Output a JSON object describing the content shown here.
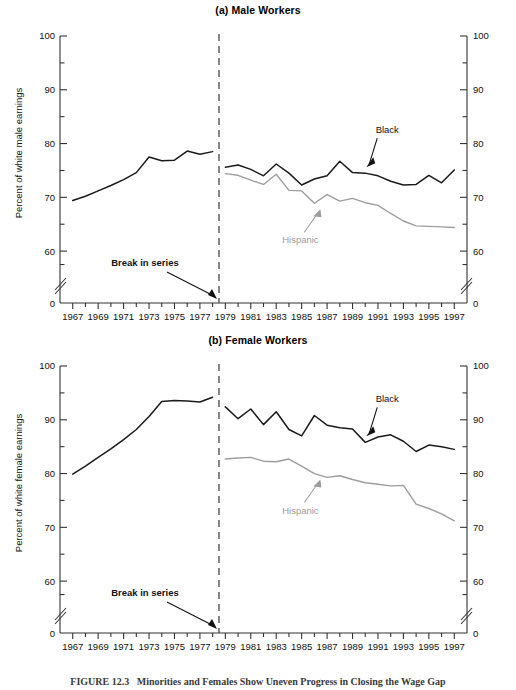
{
  "figure": {
    "caption_label": "FIGURE 12.3",
    "caption_text": "Minorities and Females Show Uneven Progress in Closing the Wage Gap"
  },
  "panels": {
    "male": {
      "title": "(a) Male Workers",
      "ylabel": "Percent of white male earnings",
      "xlabel": "Year",
      "break_label": "Break in series",
      "black_label": "Black",
      "hispanic_label": "Hispanic"
    },
    "female": {
      "title": "(b) Female Workers",
      "ylabel": "Percent of white female earnings",
      "xlabel": "Year",
      "break_label": "Break in series",
      "black_label": "Black",
      "hispanic_label": "Hispanic"
    }
  },
  "colors": {
    "black_series": "#1a1a1a",
    "hispanic_series": "#9d9d9d",
    "axis": "#333333",
    "break_line": "#555555"
  },
  "chart_data": [
    {
      "type": "line",
      "title": "(a) Male Workers",
      "xlabel": "Year",
      "ylabel": "Percent of white male earnings",
      "xlim": [
        1966,
        1998
      ],
      "ylim": [
        55,
        100
      ],
      "yticks": [
        60,
        70,
        80,
        90,
        100
      ],
      "yticks_minor": [
        65,
        75,
        85,
        95
      ],
      "ytick_zero_label": "0",
      "axis_break": true,
      "xticks": [
        1967,
        1969,
        1971,
        1973,
        1975,
        1977,
        1979,
        1981,
        1983,
        1985,
        1987,
        1989,
        1991,
        1993,
        1995,
        1997
      ],
      "grid": false,
      "legend": "inline-annotations",
      "annotations": [
        {
          "text": "Break in series",
          "year": 1978.5,
          "note": "vertical dashed line marking methodology break"
        },
        {
          "text": "Black",
          "points_to_series": "Black"
        },
        {
          "text": "Hispanic",
          "points_to_series": "Hispanic"
        }
      ],
      "series": [
        {
          "name": "Black (pre-break)",
          "color": "#1a1a1a",
          "x": [
            1967,
            1968,
            1969,
            1970,
            1971,
            1972,
            1973,
            1974,
            1975,
            1976,
            1977,
            1978
          ],
          "values": [
            69.4,
            70.2,
            71.2,
            72.2,
            73.3,
            74.6,
            77.5,
            76.8,
            76.9,
            78.6,
            78.0,
            78.5
          ]
        },
        {
          "name": "Black",
          "color": "#1a1a1a",
          "x": [
            1979,
            1980,
            1981,
            1982,
            1983,
            1984,
            1985,
            1986,
            1987,
            1988,
            1989,
            1990,
            1991,
            1992,
            1993,
            1994,
            1995,
            1996,
            1997
          ],
          "values": [
            75.6,
            76.0,
            75.2,
            74.0,
            76.2,
            74.5,
            72.3,
            73.4,
            74.0,
            76.7,
            74.6,
            74.5,
            74.0,
            73.0,
            72.3,
            72.4,
            74.1,
            72.7,
            75.1
          ]
        },
        {
          "name": "Hispanic",
          "color": "#9d9d9d",
          "x": [
            1979,
            1980,
            1981,
            1982,
            1983,
            1984,
            1985,
            1986,
            1987,
            1988,
            1989,
            1990,
            1991,
            1992,
            1993,
            1994,
            1995,
            1996,
            1997
          ],
          "values": [
            74.4,
            74.1,
            73.2,
            72.4,
            74.3,
            71.3,
            71.2,
            68.9,
            70.5,
            69.3,
            69.8,
            69.0,
            68.5,
            67.0,
            65.6,
            64.7,
            64.6,
            64.5,
            64.4
          ]
        }
      ]
    },
    {
      "type": "line",
      "title": "(b) Female Workers",
      "xlabel": "Year",
      "ylabel": "Percent of white female earnings",
      "xlim": [
        1966,
        1998
      ],
      "ylim": [
        55,
        100
      ],
      "yticks": [
        60,
        70,
        80,
        90,
        100
      ],
      "yticks_minor": [
        65,
        75,
        85,
        95
      ],
      "ytick_zero_label": "0",
      "axis_break": true,
      "xticks": [
        1967,
        1969,
        1971,
        1973,
        1975,
        1977,
        1979,
        1981,
        1983,
        1985,
        1987,
        1989,
        1991,
        1993,
        1995,
        1997
      ],
      "grid": false,
      "legend": "inline-annotations",
      "annotations": [
        {
          "text": "Break in series",
          "year": 1978.5,
          "note": "vertical dashed line marking methodology break"
        },
        {
          "text": "Black",
          "points_to_series": "Black"
        },
        {
          "text": "Hispanic",
          "points_to_series": "Hispanic"
        }
      ],
      "series": [
        {
          "name": "Black (pre-break)",
          "color": "#1a1a1a",
          "x": [
            1967,
            1968,
            1969,
            1970,
            1971,
            1972,
            1973,
            1974,
            1975,
            1976,
            1977,
            1978
          ],
          "values": [
            79.9,
            81.4,
            83.0,
            84.6,
            86.3,
            88.2,
            90.6,
            93.4,
            93.6,
            93.5,
            93.3,
            94.2
          ]
        },
        {
          "name": "Black",
          "color": "#1a1a1a",
          "x": [
            1979,
            1980,
            1981,
            1982,
            1983,
            1984,
            1985,
            1986,
            1987,
            1988,
            1989,
            1990,
            1991,
            1992,
            1993,
            1994,
            1995,
            1996,
            1997
          ],
          "values": [
            92.4,
            90.2,
            92.0,
            89.1,
            91.5,
            88.2,
            87.0,
            90.8,
            89.0,
            88.5,
            88.3,
            85.8,
            86.8,
            87.2,
            86.0,
            84.1,
            85.3,
            85.0,
            84.5
          ]
        },
        {
          "name": "Hispanic",
          "color": "#9d9d9d",
          "x": [
            1979,
            1980,
            1981,
            1982,
            1983,
            1984,
            1985,
            1986,
            1987,
            1988,
            1989,
            1990,
            1991,
            1992,
            1993,
            1994,
            1995,
            1996,
            1997
          ],
          "values": [
            82.7,
            82.9,
            83.0,
            82.3,
            82.2,
            82.7,
            81.4,
            80.0,
            79.3,
            79.6,
            78.9,
            78.3,
            78.0,
            77.7,
            77.8,
            74.3,
            73.5,
            72.5,
            71.2
          ]
        }
      ]
    }
  ]
}
